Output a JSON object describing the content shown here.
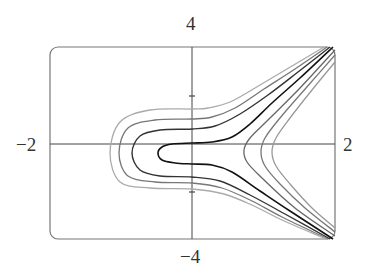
{
  "chart_data": {
    "type": "contour",
    "title": "",
    "xlabel": "",
    "ylabel": "",
    "xlim": [
      -2,
      2
    ],
    "ylim": [
      -4,
      4
    ],
    "grid": false,
    "legend": null,
    "tick_labels": {
      "x_min": "−2",
      "x_max": "2",
      "y_max": "4",
      "y_min": "−4"
    },
    "y_ticks": [
      2,
      -2
    ],
    "frame": {
      "left": 50,
      "top": 47,
      "right": 335,
      "bottom": 239,
      "radius": 8,
      "color": "#777777"
    },
    "axes_origin_px": {
      "x": 192,
      "y": 144
    },
    "left_opening_curves": [
      {
        "name": "level-1",
        "color": "#111111",
        "width": 1.6,
        "points": [
          [
            333,
            47
          ],
          [
            300,
            78
          ],
          [
            272,
            103
          ],
          [
            250,
            124
          ],
          [
            232,
            137
          ],
          [
            212,
            142
          ],
          [
            192,
            143
          ],
          [
            172,
            144
          ],
          [
            162,
            147
          ],
          [
            158,
            153
          ],
          [
            162,
            160
          ],
          [
            175,
            163
          ],
          [
            192,
            164
          ],
          [
            212,
            165
          ],
          [
            232,
            172
          ],
          [
            260,
            191
          ],
          [
            290,
            211
          ],
          [
            333,
            239
          ]
        ]
      },
      {
        "name": "level-2",
        "color": "#333333",
        "width": 1.4,
        "points": [
          [
            330,
            47
          ],
          [
            298,
            72
          ],
          [
            268,
            95
          ],
          [
            240,
            114
          ],
          [
            215,
            126
          ],
          [
            192,
            129
          ],
          [
            160,
            130
          ],
          [
            140,
            136
          ],
          [
            132,
            153
          ],
          [
            140,
            170
          ],
          [
            160,
            176
          ],
          [
            192,
            177
          ],
          [
            220,
            181
          ],
          [
            250,
            195
          ],
          [
            285,
            214
          ],
          [
            330,
            239
          ]
        ]
      },
      {
        "name": "level-3",
        "color": "#777777",
        "width": 1.3,
        "points": [
          [
            327,
            47
          ],
          [
            295,
            69
          ],
          [
            264,
            89
          ],
          [
            235,
            108
          ],
          [
            212,
            117
          ],
          [
            192,
            119
          ],
          [
            155,
            120
          ],
          [
            128,
            128
          ],
          [
            119,
            153
          ],
          [
            128,
            176
          ],
          [
            155,
            182
          ],
          [
            192,
            183
          ],
          [
            222,
            188
          ],
          [
            252,
            201
          ],
          [
            282,
            217
          ],
          [
            328,
            239
          ]
        ]
      },
      {
        "name": "level-4",
        "color": "#aaaaaa",
        "width": 1.3,
        "points": [
          [
            324,
            47
          ],
          [
            292,
            66
          ],
          [
            260,
            85
          ],
          [
            230,
            102
          ],
          [
            208,
            108
          ],
          [
            192,
            109
          ],
          [
            150,
            110
          ],
          [
            120,
            122
          ],
          [
            110,
            153
          ],
          [
            120,
            182
          ],
          [
            150,
            188
          ],
          [
            192,
            189
          ],
          [
            224,
            194
          ],
          [
            254,
            206
          ],
          [
            282,
            220
          ],
          [
            326,
            239
          ]
        ]
      }
    ],
    "right_opening_curves": [
      {
        "name": "level-r1",
        "color": "#666666",
        "width": 1.3,
        "points": [
          [
            335,
            50
          ],
          [
            300,
            88
          ],
          [
            268,
            120
          ],
          [
            250,
            138
          ],
          [
            244,
            150
          ],
          [
            247,
            162
          ],
          [
            262,
            178
          ],
          [
            295,
            208
          ],
          [
            335,
            236
          ]
        ]
      },
      {
        "name": "level-r2",
        "color": "#777777",
        "width": 1.3,
        "points": [
          [
            335,
            55
          ],
          [
            306,
            88
          ],
          [
            280,
            118
          ],
          [
            265,
            138
          ],
          [
            261,
            152
          ],
          [
            265,
            166
          ],
          [
            280,
            184
          ],
          [
            305,
            208
          ],
          [
            335,
            232
          ]
        ]
      },
      {
        "name": "level-r3",
        "color": "#999999",
        "width": 1.3,
        "points": [
          [
            335,
            62
          ],
          [
            312,
            90
          ],
          [
            290,
            118
          ],
          [
            276,
            138
          ],
          [
            272,
            152
          ],
          [
            276,
            166
          ],
          [
            290,
            184
          ],
          [
            312,
            208
          ],
          [
            335,
            228
          ]
        ]
      }
    ]
  }
}
